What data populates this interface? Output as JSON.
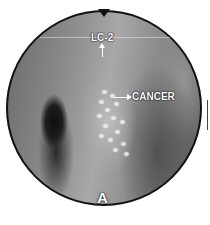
{
  "image": {
    "type": "endoscopic view",
    "shape": "circle",
    "labels": {
      "top": "LC-2",
      "right": "CANCER",
      "bottom": "A"
    },
    "annotations": [
      {
        "text": "LC-2",
        "arrow": "up"
      },
      {
        "text": "CANCER",
        "arrow": "right",
        "arrow_direction_from": "lesion"
      }
    ],
    "colors": {
      "border": "#111111",
      "label": "#ffffff",
      "background": "#ffffff"
    }
  }
}
